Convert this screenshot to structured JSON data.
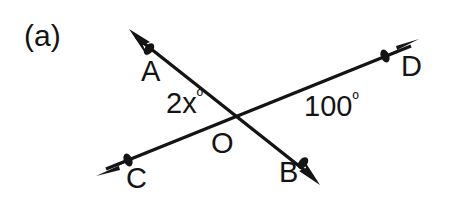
{
  "figure": {
    "subfigure_label": "(a)",
    "background_color": "#ffffff",
    "stroke_color": "#141414",
    "text_color": "#141414"
  },
  "points": {
    "a": {
      "label": "A",
      "x": 149,
      "y": 50
    },
    "b": {
      "label": "B",
      "x": 304,
      "y": 163
    },
    "c": {
      "label": "C",
      "x": 128,
      "y": 161
    },
    "d": {
      "label": "D",
      "x": 386,
      "y": 56
    },
    "o": {
      "label": "O",
      "x": 233,
      "y": 115
    }
  },
  "lines": [
    {
      "name": "line-ab",
      "from": "A",
      "to": "B",
      "tip_from": {
        "x": 132,
        "y": 33
      },
      "tip_to": {
        "x": 316,
        "y": 180
      }
    },
    {
      "name": "line-cd",
      "from": "C",
      "to": "D",
      "tip_from": {
        "x": 100,
        "y": 172
      },
      "tip_to": {
        "x": 415,
        "y": 43
      }
    }
  ],
  "angles": {
    "aoc": {
      "value": "2x",
      "unit": "º",
      "full": "2xº",
      "x": 166,
      "y": 88
    },
    "dob": {
      "value": "100",
      "unit": "º",
      "full": "100º",
      "x": 304,
      "y": 91
    }
  }
}
